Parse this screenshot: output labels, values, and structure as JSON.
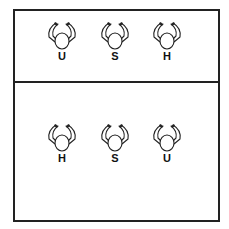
{
  "diagram": {
    "panels": [
      {
        "name": "top",
        "figures": [
          {
            "label": "U",
            "x": 45,
            "y": 20
          },
          {
            "label": "S",
            "x": 98,
            "y": 20
          },
          {
            "label": "H",
            "x": 150,
            "y": 20
          }
        ]
      },
      {
        "name": "bottom",
        "figures": [
          {
            "label": "H",
            "x": 45,
            "y": 122
          },
          {
            "label": "S",
            "x": 98,
            "y": 122
          },
          {
            "label": "U",
            "x": 150,
            "y": 122
          }
        ]
      }
    ],
    "colors": {
      "line": "#222222",
      "background": "#ffffff"
    }
  }
}
